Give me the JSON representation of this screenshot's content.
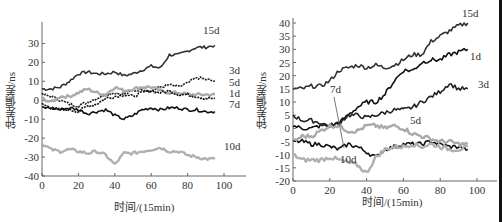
{
  "chart_data": [
    {
      "type": "line",
      "title": "",
      "xlabel": "时间/(15min)",
      "ylabel": "钟差偏差/ns",
      "xlim": [
        0,
        110
      ],
      "ylim": [
        -40,
        35
      ],
      "xticks": [
        0,
        20,
        40,
        60,
        80,
        100
      ],
      "yticks": [
        -40,
        -30,
        -20,
        -10,
        0,
        10,
        20,
        30
      ],
      "grid": false,
      "legend": "inline labels at line ends",
      "series": [
        {
          "name": "15d",
          "color": "#333333",
          "x": [
            0,
            5,
            10,
            15,
            20,
            25,
            30,
            35,
            40,
            45,
            50,
            55,
            60,
            65,
            70,
            75,
            80,
            85,
            90,
            95
          ],
          "values": [
            6,
            6,
            7,
            10,
            14,
            15,
            14,
            14,
            15,
            13,
            14,
            16,
            18,
            17,
            24,
            24,
            26,
            28,
            28,
            29
          ]
        },
        {
          "name": "3d",
          "color": "#222222",
          "x": [
            0,
            5,
            10,
            15,
            20,
            25,
            30,
            35,
            40,
            45,
            50,
            55,
            60,
            65,
            70,
            75,
            80,
            85,
            90,
            95
          ],
          "values": [
            3,
            2,
            0,
            -2,
            -3,
            -1,
            1,
            3,
            4,
            3,
            5,
            6,
            5,
            7,
            8,
            7,
            9,
            12,
            11,
            10
          ]
        },
        {
          "name": "5d",
          "color": "#aaaaaa",
          "x": [
            0,
            5,
            10,
            15,
            20,
            25,
            30,
            35,
            40,
            45,
            50,
            55,
            60,
            65,
            70,
            75,
            80,
            85,
            90,
            95
          ],
          "values": [
            1,
            -1,
            2,
            2,
            4,
            6,
            4,
            3,
            7,
            5,
            6,
            7,
            7,
            5,
            4,
            4,
            3,
            3,
            3,
            3
          ]
        },
        {
          "name": "1d",
          "color": "#111111",
          "x": [
            0,
            5,
            10,
            15,
            20,
            25,
            30,
            35,
            40,
            45,
            50,
            55,
            60,
            65,
            70,
            75,
            80,
            85,
            90,
            95
          ],
          "values": [
            -2,
            -4,
            -5,
            -5,
            -6,
            -3,
            -2,
            1,
            2,
            3,
            2,
            4,
            5,
            4,
            5,
            3,
            3,
            2,
            1,
            1
          ]
        },
        {
          "name": "7d",
          "color": "#111111",
          "x": [
            0,
            5,
            10,
            15,
            20,
            25,
            30,
            35,
            40,
            45,
            50,
            55,
            60,
            65,
            70,
            75,
            80,
            85,
            90,
            95
          ],
          "values": [
            -4,
            -4,
            -5,
            -4,
            -5,
            -7,
            -6,
            -5,
            -8,
            -10,
            -8,
            -5,
            -4,
            -5,
            -4,
            -4,
            -5,
            -5,
            -6,
            -6
          ]
        },
        {
          "name": "10d",
          "color": "#b0b0b0",
          "x": [
            0,
            5,
            10,
            15,
            20,
            25,
            30,
            35,
            40,
            45,
            50,
            55,
            60,
            65,
            70,
            75,
            80,
            85,
            90,
            95
          ],
          "values": [
            -23,
            -26,
            -27,
            -26,
            -27,
            -28,
            -27,
            -29,
            -34,
            -28,
            -28,
            -27,
            -26,
            -25,
            -27,
            -27,
            -29,
            -30,
            -31,
            -31
          ]
        }
      ]
    },
    {
      "type": "line",
      "title": "",
      "xlabel": "时间/(15min)",
      "ylabel": "钟差偏差/ns",
      "xlim": [
        0,
        110
      ],
      "ylim": [
        -20,
        40
      ],
      "xticks": [
        0,
        20,
        40,
        60,
        80,
        100
      ],
      "yticks": [
        -20,
        -15,
        -10,
        -5,
        0,
        5,
        10,
        15,
        20,
        25,
        30,
        35,
        40
      ],
      "grid": false,
      "legend": "inline labels at line ends",
      "series": [
        {
          "name": "15d",
          "color": "#333333",
          "x": [
            0,
            5,
            10,
            15,
            20,
            25,
            30,
            35,
            40,
            45,
            50,
            55,
            60,
            65,
            70,
            75,
            80,
            85,
            90,
            95
          ],
          "values": [
            15,
            15,
            16,
            16,
            18,
            22,
            23,
            24,
            23,
            24,
            23,
            24,
            26,
            28,
            28,
            33,
            35,
            37,
            39,
            40
          ]
        },
        {
          "name": "1d",
          "color": "#111111",
          "x": [
            0,
            5,
            10,
            15,
            20,
            25,
            30,
            35,
            40,
            45,
            50,
            55,
            60,
            65,
            70,
            75,
            80,
            85,
            90,
            95
          ],
          "values": [
            1,
            0,
            0,
            1,
            1,
            2,
            5,
            8,
            10,
            10,
            13,
            18,
            22,
            22,
            25,
            26,
            26,
            28,
            29,
            30
          ]
        },
        {
          "name": "3d",
          "color": "#222222",
          "x": [
            0,
            5,
            10,
            15,
            20,
            25,
            30,
            35,
            40,
            45,
            50,
            55,
            60,
            65,
            70,
            75,
            80,
            85,
            90,
            95
          ],
          "values": [
            5,
            3,
            3,
            2,
            1,
            2,
            5,
            5,
            4,
            5,
            6,
            7,
            7,
            8,
            10,
            12,
            14,
            17,
            15,
            15
          ]
        },
        {
          "name": "7d",
          "color": "#111111",
          "x": [
            0,
            5,
            10,
            15,
            20,
            25,
            30,
            35,
            40,
            45,
            50,
            55,
            60,
            65,
            70,
            75,
            80,
            85,
            90,
            95
          ],
          "values": [
            -5,
            -5,
            -6,
            -6,
            -7,
            -8,
            -6,
            -7,
            -9,
            -11,
            -8,
            -7,
            -6,
            -6,
            -6,
            -5,
            -6,
            -7,
            -7,
            -8
          ]
        },
        {
          "name": "5d",
          "color": "#aaaaaa",
          "x": [
            0,
            5,
            10,
            15,
            20,
            25,
            30,
            35,
            40,
            45,
            50,
            55,
            60,
            65,
            70,
            75,
            80,
            85,
            90,
            95
          ],
          "values": [
            -5,
            -3,
            -3,
            -1,
            1,
            1,
            -1,
            -1,
            1,
            1,
            0,
            1,
            0,
            -2,
            -3,
            -4,
            -5,
            -5,
            -6,
            -6
          ]
        },
        {
          "name": "10d",
          "color": "#b0b0b0",
          "x": [
            0,
            5,
            10,
            15,
            20,
            25,
            30,
            35,
            40,
            45,
            50,
            55,
            60,
            65,
            70,
            75,
            80,
            85,
            90,
            95
          ],
          "values": [
            -10,
            -12,
            -12,
            -12,
            -11,
            -12,
            -13,
            -14,
            -17,
            -11,
            -8,
            -7,
            -7,
            -6,
            -7,
            -6,
            -7,
            -8,
            -8,
            -7
          ]
        }
      ],
      "annotations": [
        {
          "text": "7d",
          "pointer": true
        }
      ]
    }
  ],
  "charts": [
    {
      "xlabel": "时间/(15min)",
      "ylabel": "钟差偏差/ns"
    },
    {
      "xlabel": "时间/(15min)",
      "ylabel": "钟差偏差/ns"
    }
  ]
}
